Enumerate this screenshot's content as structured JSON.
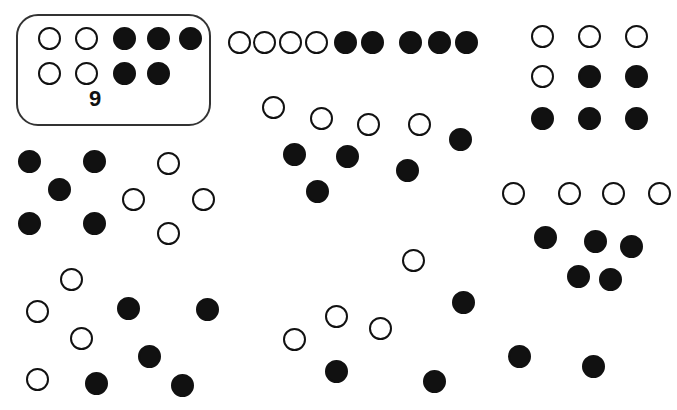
{
  "page": {
    "width": 677,
    "height": 410,
    "background": "#ffffff",
    "ink_color": "#111111"
  },
  "example": {
    "label": "9",
    "label_x": 89,
    "label_y": 88,
    "box": {
      "x": 16,
      "y": 14,
      "w": 195,
      "h": 112
    },
    "open_count": 4,
    "filled_count": 5,
    "total": 9
  },
  "dot_style": {
    "diameter": 23,
    "stroke_width": 2,
    "open_fill": "#ffffff",
    "filled_fill": "#111111",
    "stroke_color": "#111111"
  },
  "chart_data": {
    "type": "scatter",
    "xlabel": "",
    "ylabel": "",
    "xlim": [
      0,
      677
    ],
    "ylim": [
      0,
      410
    ],
    "grid": false,
    "legend": [
      "open circle",
      "filled circle"
    ],
    "note": "Eight groups, each containing 9 dots (4 open + 5 filled). One group is boxed and labelled 9.",
    "groups": [
      {
        "name": "example-boxed",
        "boxed": true,
        "label": "9",
        "open_count": 4,
        "filled_count": 5,
        "total": 9,
        "open": [
          {
            "x": 38,
            "y": 27
          },
          {
            "x": 75,
            "y": 27
          },
          {
            "x": 38,
            "y": 62
          },
          {
            "x": 75,
            "y": 62
          }
        ],
        "filled": [
          {
            "x": 113,
            "y": 27
          },
          {
            "x": 147,
            "y": 27
          },
          {
            "x": 179,
            "y": 27
          },
          {
            "x": 113,
            "y": 62
          },
          {
            "x": 147,
            "y": 62
          }
        ]
      },
      {
        "name": "top-row",
        "boxed": false,
        "open_count": 4,
        "filled_count": 5,
        "total": 9,
        "open": [
          {
            "x": 228,
            "y": 31
          },
          {
            "x": 253,
            "y": 31
          },
          {
            "x": 279,
            "y": 31
          },
          {
            "x": 305,
            "y": 31
          }
        ],
        "filled": [
          {
            "x": 334,
            "y": 31
          },
          {
            "x": 361,
            "y": 31
          },
          {
            "x": 399,
            "y": 31
          },
          {
            "x": 428,
            "y": 31
          },
          {
            "x": 455,
            "y": 31
          }
        ]
      },
      {
        "name": "top-right-grid",
        "boxed": false,
        "open_count": 4,
        "filled_count": 5,
        "total": 9,
        "open": [
          {
            "x": 531,
            "y": 25
          },
          {
            "x": 578,
            "y": 25
          },
          {
            "x": 625,
            "y": 25
          },
          {
            "x": 531,
            "y": 65
          }
        ],
        "filled": [
          {
            "x": 578,
            "y": 65
          },
          {
            "x": 625,
            "y": 65
          },
          {
            "x": 531,
            "y": 107
          },
          {
            "x": 578,
            "y": 107
          },
          {
            "x": 625,
            "y": 107
          }
        ]
      },
      {
        "name": "middle-center",
        "boxed": false,
        "open_count": 4,
        "filled_count": 5,
        "total": 9,
        "open": [
          {
            "x": 262,
            "y": 96
          },
          {
            "x": 310,
            "y": 107
          },
          {
            "x": 357,
            "y": 113
          },
          {
            "x": 408,
            "y": 113
          }
        ],
        "filled": [
          {
            "x": 283,
            "y": 143
          },
          {
            "x": 336,
            "y": 145
          },
          {
            "x": 396,
            "y": 159
          },
          {
            "x": 449,
            "y": 128
          },
          {
            "x": 306,
            "y": 180
          }
        ]
      },
      {
        "name": "middle-left",
        "boxed": false,
        "open_count": 4,
        "filled_count": 5,
        "total": 9,
        "open": [
          {
            "x": 157,
            "y": 152
          },
          {
            "x": 122,
            "y": 188
          },
          {
            "x": 192,
            "y": 188
          },
          {
            "x": 157,
            "y": 222
          }
        ],
        "filled": [
          {
            "x": 18,
            "y": 150
          },
          {
            "x": 83,
            "y": 150
          },
          {
            "x": 48,
            "y": 178
          },
          {
            "x": 18,
            "y": 212
          },
          {
            "x": 83,
            "y": 212
          }
        ]
      },
      {
        "name": "middle-right",
        "boxed": false,
        "open_count": 4,
        "filled_count": 5,
        "total": 9,
        "open": [
          {
            "x": 502,
            "y": 182
          },
          {
            "x": 558,
            "y": 182
          },
          {
            "x": 602,
            "y": 182
          },
          {
            "x": 648,
            "y": 182
          }
        ],
        "filled": [
          {
            "x": 534,
            "y": 226
          },
          {
            "x": 584,
            "y": 230
          },
          {
            "x": 620,
            "y": 235
          },
          {
            "x": 567,
            "y": 265
          },
          {
            "x": 599,
            "y": 268
          }
        ]
      },
      {
        "name": "bottom-left",
        "boxed": false,
        "open_count": 4,
        "filled_count": 5,
        "total": 9,
        "open": [
          {
            "x": 60,
            "y": 268
          },
          {
            "x": 26,
            "y": 300
          },
          {
            "x": 70,
            "y": 327
          },
          {
            "x": 26,
            "y": 368
          }
        ],
        "filled": [
          {
            "x": 117,
            "y": 297
          },
          {
            "x": 196,
            "y": 298
          },
          {
            "x": 138,
            "y": 345
          },
          {
            "x": 85,
            "y": 372
          },
          {
            "x": 171,
            "y": 374
          }
        ]
      },
      {
        "name": "bottom-center",
        "boxed": false,
        "open_count": 4,
        "filled_count": 5,
        "total": 9,
        "open": [
          {
            "x": 402,
            "y": 249
          },
          {
            "x": 325,
            "y": 305
          },
          {
            "x": 369,
            "y": 317
          },
          {
            "x": 283,
            "y": 328
          }
        ],
        "filled": [
          {
            "x": 452,
            "y": 291
          },
          {
            "x": 325,
            "y": 360
          },
          {
            "x": 423,
            "y": 370
          },
          {
            "x": 508,
            "y": 345
          },
          {
            "x": 582,
            "y": 355
          }
        ]
      }
    ]
  }
}
